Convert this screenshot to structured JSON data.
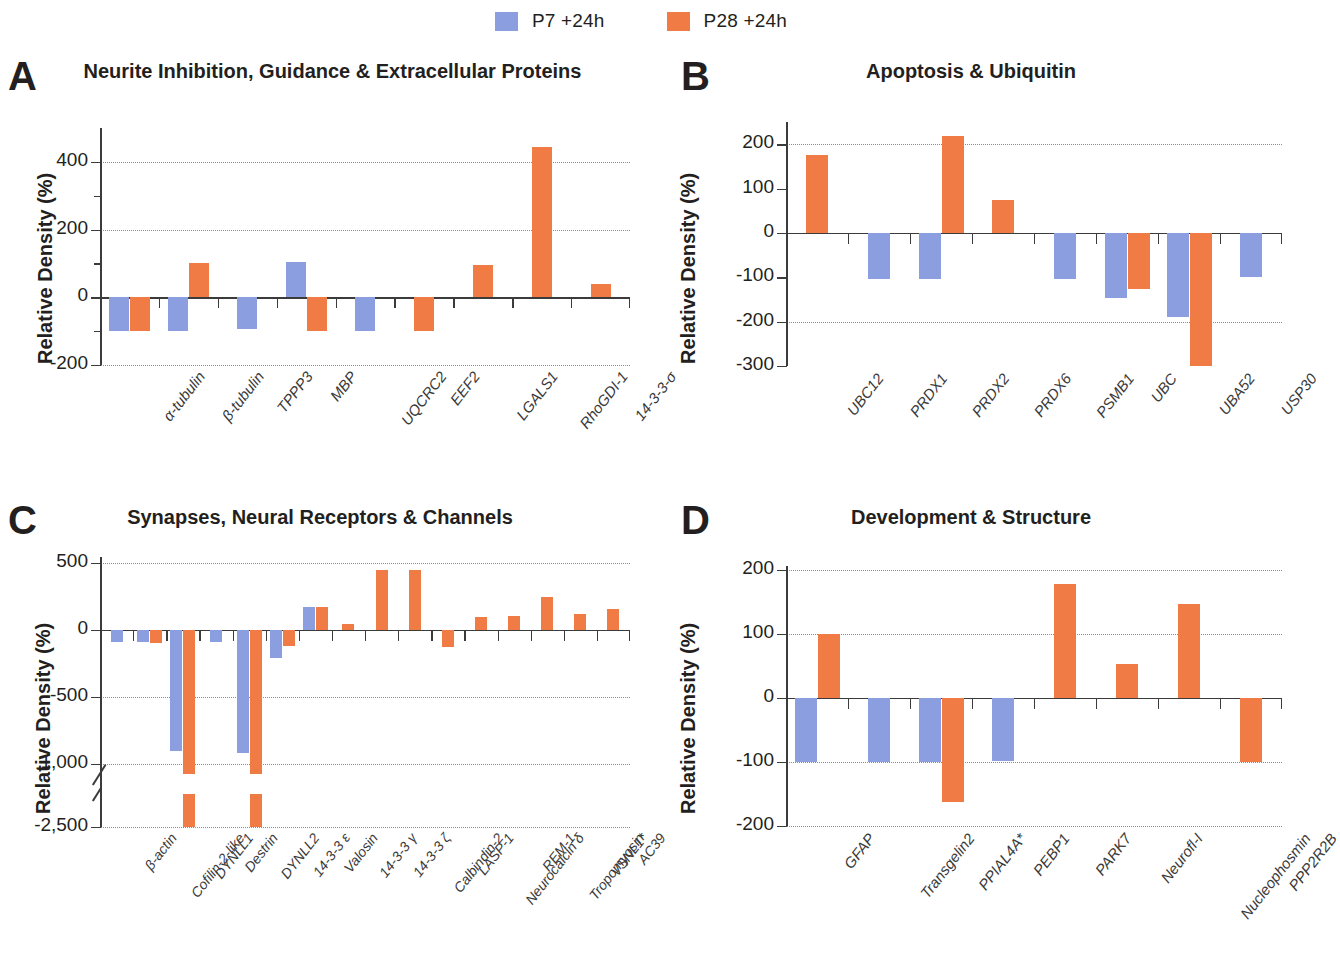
{
  "legend": {
    "items": [
      {
        "label": "P7 +24h",
        "color": "#8a9ee0",
        "key": "p7"
      },
      {
        "label": "P28 +24h",
        "color": "#f07b45",
        "key": "p28"
      }
    ]
  },
  "colors": {
    "p7": "#8a9ee0",
    "p28": "#f07b45",
    "axis": "#3b3b3b",
    "grid": "#8c8c8c"
  },
  "panels": {
    "A": {
      "letter": "A",
      "title": "Neurite Inhibition, Guidance & Extracellular Proteins",
      "ylabel": "Relative Density (%)"
    },
    "B": {
      "letter": "B",
      "title": "Apoptosis & Ubiquitin",
      "ylabel": "Relative Density (%)"
    },
    "C": {
      "letter": "C",
      "title": "Synapses, Neural Receptors & Channels",
      "ylabel": "Relative Density (%)"
    },
    "D": {
      "letter": "D",
      "title": "Development & Structure",
      "ylabel": "Relative Density (%)"
    }
  },
  "chart_data": [
    {
      "panel": "A",
      "type": "bar",
      "title": "Neurite Inhibition, Guidance & Extracellular Proteins",
      "xlabel": "",
      "ylabel": "Relative Density (%)",
      "ylim": [
        -200,
        500
      ],
      "yticks": [
        -200,
        0,
        200,
        400
      ],
      "ytick_labels": [
        "-200",
        "0",
        "200",
        "400"
      ],
      "grid": true,
      "legend_position": "top-center",
      "categories": [
        "α-tubulin",
        "β-tubulin",
        "TPPP3",
        "MBP",
        "UQCRC2",
        "EEF2",
        "LGALS1",
        "RhoGDI-1",
        "14-3-3-σ"
      ],
      "series": [
        {
          "name": "P7 +24h",
          "color": "#8a9ee0",
          "values": [
            -100,
            -100,
            -95,
            105,
            -100,
            null,
            null,
            null,
            null
          ]
        },
        {
          "name": "P28 +24h",
          "color": "#f07b45",
          "values": [
            -100,
            100,
            null,
            -100,
            null,
            -100,
            95,
            445,
            40
          ]
        }
      ]
    },
    {
      "panel": "B",
      "type": "bar",
      "title": "Apoptosis & Ubiquitin",
      "xlabel": "",
      "ylabel": "Relative Density (%)",
      "ylim": [
        -300,
        250
      ],
      "yticks": [
        -300,
        -200,
        -100,
        0,
        100,
        200
      ],
      "ytick_labels": [
        "-300",
        "-200",
        "-100",
        "0",
        "100",
        "200"
      ],
      "grid": true,
      "legend_position": "top-center",
      "categories": [
        "UBC12",
        "PRDX1",
        "PRDX2",
        "PRDX6",
        "PSMB1",
        "UBC",
        "UBA52",
        "USP30"
      ],
      "series": [
        {
          "name": "P7 +24h",
          "color": "#8a9ee0",
          "values": [
            null,
            -103,
            -103,
            null,
            -103,
            -147,
            -190,
            -100
          ]
        },
        {
          "name": "P28 +24h",
          "color": "#f07b45",
          "values": [
            175,
            null,
            218,
            75,
            null,
            -127,
            -300,
            null
          ]
        }
      ]
    },
    {
      "panel": "C",
      "type": "bar",
      "title": "Synapses, Neural Receptors & Channels",
      "xlabel": "",
      "ylabel": "Relative Density (%)",
      "ylim": [
        -2500,
        500
      ],
      "yticks": [
        -2500,
        -1000,
        -500,
        0,
        500
      ],
      "ytick_labels": [
        "-2,500",
        "1,000",
        "-500",
        "0",
        "500"
      ],
      "axis_break": {
        "between": [
          -1000,
          -2500
        ],
        "note": "broken y-axis between -1,000 and -2,500"
      },
      "grid": true,
      "legend_position": "top-center",
      "categories": [
        "β-actin",
        "Cofilin-2-like",
        "DYNLL1",
        "Destrin",
        "DYNLL2",
        "14-3-3 ε",
        "Valosin",
        "14-3-3 γ",
        "14-3-3 ζ",
        "Calbindin-2",
        "LASP-1",
        "Neurocalcin δ",
        "REM-1",
        "Tropomyosin",
        "VSNL1*",
        "AC39"
      ],
      "series": [
        {
          "name": "P7 +24h",
          "color": "#8a9ee0",
          "values": [
            -90,
            -90,
            -900,
            -90,
            -920,
            -210,
            175,
            null,
            null,
            null,
            null,
            null,
            null,
            null,
            null,
            null
          ]
        },
        {
          "name": "P28 +24h",
          "color": "#f07b45",
          "values": [
            null,
            -95,
            -2500,
            null,
            -2500,
            -120,
            175,
            45,
            450,
            445,
            -130,
            100,
            105,
            250,
            120,
            160
          ]
        }
      ]
    },
    {
      "panel": "D",
      "type": "bar",
      "title": "Development & Structure",
      "xlabel": "",
      "ylabel": "Relative Density (%)",
      "ylim": [
        -200,
        200
      ],
      "yticks": [
        -200,
        -100,
        0,
        100,
        200
      ],
      "ytick_labels": [
        "-200",
        "-100",
        "0",
        "100",
        "200"
      ],
      "grid": true,
      "legend_position": "top-center",
      "categories": [
        "GFAP",
        "Transgelin2",
        "PPIAL4A*",
        "PEBP1",
        "PARK7",
        "Neurofl-I",
        "Nucleophosmin",
        "PPP2R2B"
      ],
      "series": [
        {
          "name": "P7 +24h",
          "color": "#8a9ee0",
          "values": [
            -100,
            -100,
            -100,
            -98,
            null,
            null,
            null,
            null
          ]
        },
        {
          "name": "P28 +24h",
          "color": "#f07b45",
          "values": [
            100,
            null,
            -162,
            null,
            178,
            53,
            147,
            -100
          ]
        }
      ]
    }
  ]
}
